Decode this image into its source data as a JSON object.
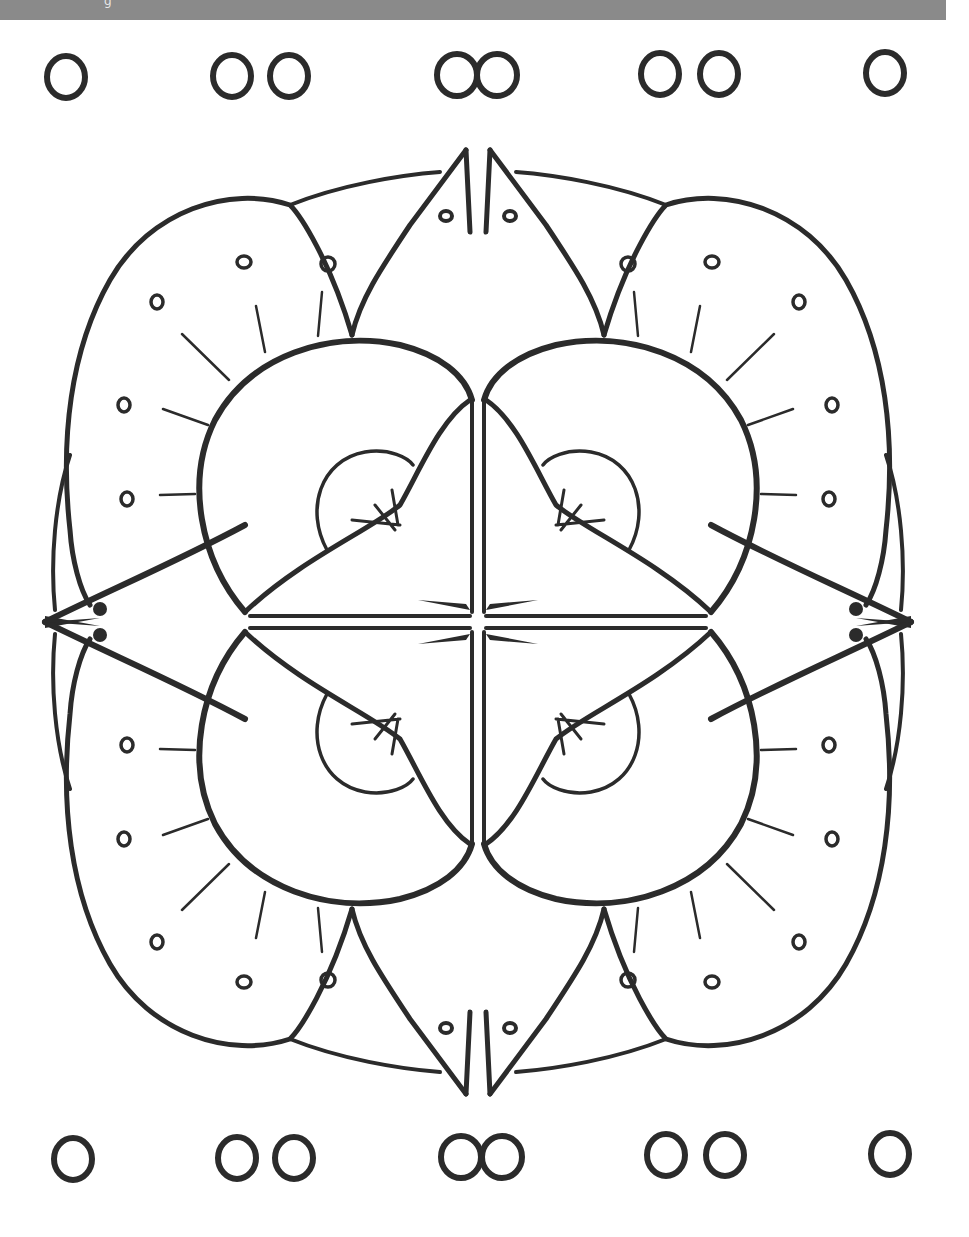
{
  "page": {
    "type": "coloring-page",
    "background": "#ffffff",
    "ink_color": "#2b2b2b"
  },
  "banner": {
    "color": "#8a8a8a",
    "caption": "g"
  },
  "decor": {
    "top_row": [
      {
        "cx": 66,
        "cy": 74,
        "count": 1
      },
      {
        "cx": 260,
        "cy": 74,
        "count": 2
      },
      {
        "cx": 476,
        "cy": 74,
        "count": 2,
        "overlap": true
      },
      {
        "cx": 690,
        "cy": 74,
        "count": 2
      },
      {
        "cx": 886,
        "cy": 74,
        "count": 1
      }
    ],
    "bottom_row": [
      {
        "cx": 73,
        "cy": 1160,
        "count": 1
      },
      {
        "cx": 265,
        "cy": 1160,
        "count": 2
      },
      {
        "cx": 480,
        "cy": 1160,
        "count": 2,
        "overlap": true
      },
      {
        "cx": 695,
        "cy": 1160,
        "count": 2
      },
      {
        "cx": 890,
        "cy": 1160,
        "count": 1
      }
    ]
  },
  "mandala": {
    "center": {
      "x": 478,
      "y": 622
    },
    "outer_ring_rx": 432,
    "outer_ring_ry": 470,
    "quadrants": 4,
    "features": [
      "outer-petals-with-dots",
      "pointed-spikes-N-S",
      "fish-heads-E-W",
      "inner-rounded-lobes",
      "half-circle-buds",
      "central-star"
    ]
  }
}
